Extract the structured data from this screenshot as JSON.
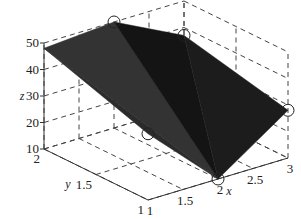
{
  "chart_data": {
    "type": "surface3d",
    "title": "",
    "xlabel": "x",
    "ylabel": "y",
    "zlabel": "z",
    "xlim": [
      1,
      3
    ],
    "ylim": [
      1,
      2
    ],
    "zlim": [
      10,
      50
    ],
    "xticks": [
      1,
      1.5,
      2,
      2.5,
      3
    ],
    "yticks": [
      1,
      1.5,
      2
    ],
    "zticks": [
      10,
      20,
      30,
      40,
      50
    ],
    "xtick_labels": [
      "1",
      "1.5",
      "2",
      "2.5",
      "3"
    ],
    "ytick_labels": [
      "1",
      "1.5",
      "2"
    ],
    "ztick_labels": [
      "10",
      "20",
      "30",
      "40",
      "50"
    ],
    "grid": true,
    "points": [
      {
        "x": 1,
        "y": 2,
        "z": 48
      },
      {
        "x": 2,
        "y": 2,
        "z": 50
      },
      {
        "x": 3,
        "y": 2,
        "z": 37
      },
      {
        "x": 1,
        "y": 1,
        "z": 35
      },
      {
        "x": 2,
        "y": 1,
        "z": 10
      },
      {
        "x": 3,
        "y": 1,
        "z": 28
      }
    ],
    "triangles": [
      [
        0,
        1,
        4
      ],
      [
        0,
        4,
        3
      ],
      [
        1,
        2,
        4
      ],
      [
        2,
        5,
        4
      ]
    ],
    "face_color": "#2a2a2a",
    "marker": "circle",
    "marker_points": [
      {
        "x": 2,
        "y": 2,
        "z": 50
      },
      {
        "x": 3,
        "y": 2,
        "z": 37
      },
      {
        "x": 1,
        "y": 1,
        "z": 35
      },
      {
        "x": 2,
        "y": 1,
        "z": 10
      },
      {
        "x": 3,
        "y": 1,
        "z": 28
      }
    ]
  }
}
